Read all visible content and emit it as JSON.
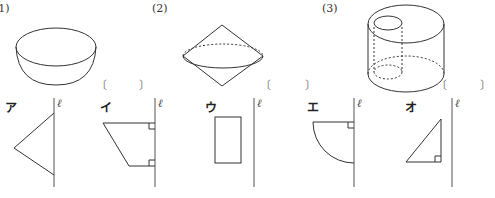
{
  "questions": [
    {
      "number": "(1)",
      "solid": "hemisphere",
      "answer_bracket": {
        "open": "〔",
        "close": "〕",
        "value": ""
      }
    },
    {
      "number": "(2)",
      "solid": "double cone",
      "answer_bracket": {
        "open": "〔",
        "close": "〕",
        "value": ""
      }
    },
    {
      "number": "(3)",
      "solid": "hollow cylinder",
      "answer_bracket": {
        "open": "〔",
        "close": "〕",
        "value": ""
      }
    }
  ],
  "choices": [
    {
      "label": "ア",
      "axis_label": "ℓ",
      "shape": "isosceles triangle touching axis"
    },
    {
      "label": "イ",
      "axis_label": "ℓ",
      "shape": "right trapezoid on axis"
    },
    {
      "label": "ウ",
      "axis_label": "ℓ",
      "shape": "rectangle away from axis"
    },
    {
      "label": "エ",
      "axis_label": "ℓ",
      "shape": "quarter circle on axis"
    },
    {
      "label": "オ",
      "axis_label": "ℓ",
      "shape": "right triangle away from axis"
    }
  ],
  "colors": {
    "line": "#333333",
    "dashed": "#444444",
    "axis": "#555555",
    "bracket": "#777777"
  }
}
